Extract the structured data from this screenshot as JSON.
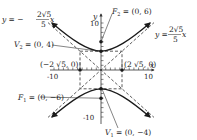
{
  "diagram": {
    "type": "hyperbola-graph",
    "equation_summary": "Vertical hyperbola centered at origin with a = 4, b = 2√5, c = 6",
    "axes": {
      "x_label": "x",
      "y_label": "y",
      "x_ticks": [
        "-10",
        "10"
      ],
      "y_ticks": [
        "10",
        "-10"
      ]
    },
    "labels": {
      "asymptote_neg": {
        "lhs": "y = −",
        "num": "2√5",
        "den": "5",
        "var": "x"
      },
      "asymptote_pos": {
        "lhs": "y = ",
        "num": "2√5",
        "den": "5",
        "var": "x"
      },
      "focus_top": {
        "name": "F",
        "sub": "2",
        "text": " = (0, 6)"
      },
      "vertex_top": {
        "name": "V",
        "sub": "2",
        "text": " = (0, 4)"
      },
      "co_vertex_left": "(−2 √5, 0)",
      "co_vertex_right": "(2 √5, 0)",
      "focus_bottom": {
        "name": "F",
        "sub": "1",
        "text": " = (0, −6)"
      },
      "vertex_bottom": {
        "name": "V",
        "sub": "1",
        "text": " = (0, −4)"
      }
    },
    "points": {
      "F2": [
        0,
        6
      ],
      "V2": [
        0,
        4
      ],
      "V1": [
        0,
        -4
      ],
      "F1": [
        0,
        -6
      ],
      "left": [
        "-2√5",
        0
      ],
      "right": [
        "2√5",
        0
      ]
    },
    "colors": {
      "curve": "#1a1a1a",
      "axis": "#333333",
      "dashed": "#333333"
    }
  }
}
